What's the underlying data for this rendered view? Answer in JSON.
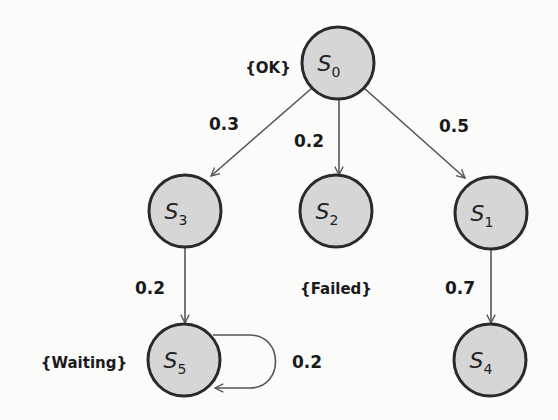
{
  "diagram": {
    "type": "markov-chain",
    "colors": {
      "node_fill": "#d6d6d6",
      "node_stroke": "#2a2a2a",
      "edge": "#555555",
      "text": "#1a1a1a",
      "background": "#fbfbfa"
    },
    "nodes": [
      {
        "id": "S0",
        "letter": "S",
        "sub": "0",
        "cx": 338,
        "cy": 63,
        "r": 36,
        "label": "{OK}"
      },
      {
        "id": "S1",
        "letter": "S",
        "sub": "1",
        "cx": 491,
        "cy": 213,
        "r": 36,
        "label": ""
      },
      {
        "id": "S2",
        "letter": "S",
        "sub": "2",
        "cx": 336,
        "cy": 211,
        "r": 36,
        "label": "{Failed}"
      },
      {
        "id": "S3",
        "letter": "S",
        "sub": "3",
        "cx": 185,
        "cy": 211,
        "r": 36,
        "label": ""
      },
      {
        "id": "S4",
        "letter": "S",
        "sub": "4",
        "cx": 490,
        "cy": 360,
        "r": 36,
        "label": ""
      },
      {
        "id": "S5",
        "letter": "S",
        "sub": "5",
        "cx": 184,
        "cy": 360,
        "r": 36,
        "label": "{Waiting}"
      }
    ],
    "edges": [
      {
        "from": "S0",
        "to": "S3",
        "probability": "0.3"
      },
      {
        "from": "S0",
        "to": "S2",
        "probability": "0.2"
      },
      {
        "from": "S0",
        "to": "S1",
        "probability": "0.5"
      },
      {
        "from": "S3",
        "to": "S5",
        "probability": "0.2"
      },
      {
        "from": "S1",
        "to": "S4",
        "probability": "0.7"
      },
      {
        "from": "S5",
        "to": "S5",
        "probability": "0.2"
      }
    ]
  }
}
